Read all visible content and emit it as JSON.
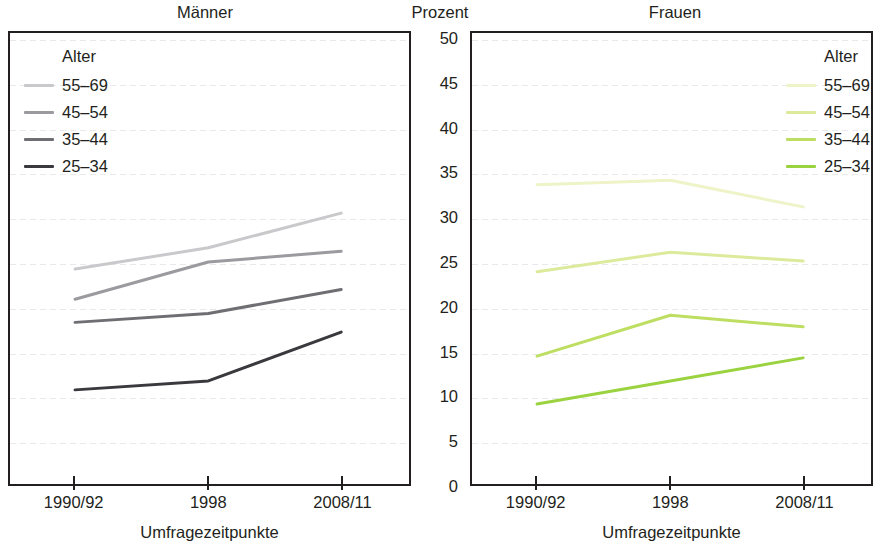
{
  "titles": {
    "left_panel": "Männer",
    "axis_unit": "Prozent",
    "right_panel": "Frauen"
  },
  "y_axis": {
    "label": "Prozent",
    "ticks": [
      "50",
      "45",
      "40",
      "35",
      "30",
      "25",
      "20",
      "15",
      "10",
      "5",
      "0"
    ]
  },
  "x_axis": {
    "title": "Umfragezeitpunkte",
    "ticks": [
      "1990/92",
      "1998",
      "2008/11"
    ]
  },
  "legend_left": {
    "title": "Alter",
    "items": [
      {
        "label": "55–69",
        "color": "#c9c9cc"
      },
      {
        "label": "45–54",
        "color": "#9a9a9f"
      },
      {
        "label": "35–44",
        "color": "#6e6e73"
      },
      {
        "label": "25–34",
        "color": "#3a3a3e"
      }
    ]
  },
  "legend_right": {
    "title": "Alter",
    "items": [
      {
        "label": "55–69",
        "color": "#eef3c8"
      },
      {
        "label": "45–54",
        "color": "#dcea9c"
      },
      {
        "label": "35–44",
        "color": "#bede62"
      },
      {
        "label": "25–34",
        "color": "#9ad33f"
      }
    ]
  },
  "chart_data": [
    {
      "type": "line",
      "title": "Männer",
      "xlabel": "Umfragezeitpunkte",
      "ylabel": "Prozent",
      "categories": [
        "1990/92",
        "1998",
        "2008/11"
      ],
      "ylim": [
        0,
        50
      ],
      "ytick_step": 5,
      "grid": true,
      "legend_title": "Alter",
      "legend_position": "top-left",
      "series": [
        {
          "name": "55–69",
          "values": [
            24.2,
            26.6,
            30.5
          ],
          "color": "#c9c9cc"
        },
        {
          "name": "45–54",
          "values": [
            20.8,
            25.0,
            26.2
          ],
          "color": "#9a9a9f"
        },
        {
          "name": "35–44",
          "values": [
            18.2,
            19.2,
            21.9
          ],
          "color": "#6e6e73"
        },
        {
          "name": "25–34",
          "values": [
            10.6,
            11.6,
            17.1
          ],
          "color": "#3a3a3e"
        }
      ]
    },
    {
      "type": "line",
      "title": "Frauen",
      "xlabel": "Umfragezeitpunkte",
      "ylabel": "Prozent",
      "categories": [
        "1990/92",
        "1998",
        "2008/11"
      ],
      "ylim": [
        0,
        50
      ],
      "ytick_step": 5,
      "grid": true,
      "legend_title": "Alter",
      "legend_position": "top-right",
      "series": [
        {
          "name": "55–69",
          "values": [
            33.7,
            34.2,
            31.2
          ],
          "color": "#eef3c8"
        },
        {
          "name": "45–54",
          "values": [
            23.9,
            26.1,
            25.1
          ],
          "color": "#dcea9c"
        },
        {
          "name": "35–44",
          "values": [
            14.4,
            19.0,
            17.7
          ],
          "color": "#bede62"
        },
        {
          "name": "25–34",
          "values": [
            9.0,
            11.6,
            14.2
          ],
          "color": "#9ad33f"
        }
      ]
    }
  ]
}
